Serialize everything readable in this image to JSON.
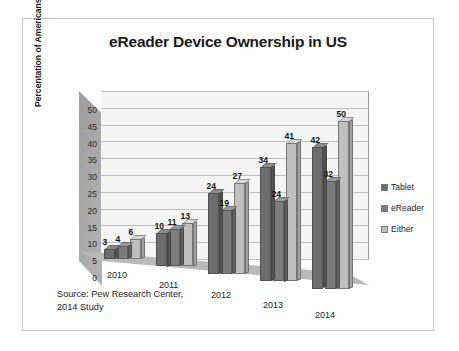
{
  "chart_data": {
    "type": "bar",
    "title": "eReader Device Ownership in US",
    "xlabel": "",
    "ylabel": "Percentation of Americans",
    "categories": [
      "2010",
      "2011",
      "2012",
      "2013",
      "2014"
    ],
    "series": [
      {
        "name": "Tablet",
        "values": [
          3,
          10,
          24,
          34,
          42
        ],
        "color": "#6d6d6d"
      },
      {
        "name": "eReader",
        "values": [
          4,
          11,
          19,
          24,
          32
        ],
        "color": "#7d7d7d"
      },
      {
        "name": "Either",
        "values": [
          6,
          13,
          27,
          41,
          50
        ],
        "color": "#bfbfbf"
      }
    ],
    "ylim": [
      0,
      50
    ],
    "yticks": [
      0,
      5,
      10,
      15,
      20,
      25,
      30,
      35,
      40,
      45,
      50
    ],
    "grid": true,
    "legend_position": "right",
    "style": "3d-column",
    "data_labels": true,
    "annotation": "Source: Pew Research Center,\n2014 Study"
  },
  "legend": {
    "items": [
      {
        "label": "Tablet",
        "color": "#6d6d6d"
      },
      {
        "label": "eReader",
        "color": "#7d7d7d"
      },
      {
        "label": "Either",
        "color": "#bfbfbf"
      }
    ]
  },
  "source_note": "Source: Pew Research Center,\n2014 Study"
}
